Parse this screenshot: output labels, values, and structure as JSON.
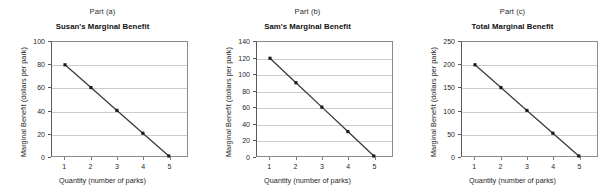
{
  "figure": {
    "background_color": "#ffffff",
    "line_color": "#3a3a3a",
    "marker_color": "#1a1a1a",
    "grid_color": "#cccccc",
    "axis_color": "#5a5a5a",
    "border_color": "#8c8c8c"
  },
  "panels": [
    {
      "part_label": "Part (a)",
      "title": "Susan's Marginal Benefit",
      "xlabel": "Quantity (number of parks)",
      "ylabel": "Marginal Benefit (dollars per park)",
      "x_ticks": [
        "1",
        "2",
        "3",
        "4",
        "5"
      ],
      "y_ticks": [
        "0",
        "20",
        "40",
        "60",
        "80",
        "100"
      ]
    },
    {
      "part_label": "Part (b)",
      "title": "Sam's Marginal Benefit",
      "xlabel": "Quantity (number of parks)",
      "ylabel": "Marginal Benefit (dollars per park)",
      "x_ticks": [
        "1",
        "2",
        "3",
        "4",
        "5"
      ],
      "y_ticks": [
        "0",
        "20",
        "40",
        "60",
        "80",
        "100",
        "120",
        "140"
      ]
    },
    {
      "part_label": "Part (c)",
      "title": "Total Marginal Benefit",
      "xlabel": "Quantity (number of parks)",
      "ylabel": "Marginal Benefit (dollars per park)",
      "x_ticks": [
        "1",
        "2",
        "3",
        "4",
        "5"
      ],
      "y_ticks": [
        "0",
        "50",
        "100",
        "150",
        "200",
        "250"
      ]
    }
  ],
  "chart_data": [
    {
      "type": "line",
      "title": "Susan's Marginal Benefit",
      "subtitle": "Part (a)",
      "xlabel": "Quantity (number of parks)",
      "ylabel": "Marginal Benefit (dollars per park)",
      "x": [
        1,
        2,
        3,
        4,
        5
      ],
      "values": [
        80,
        60,
        40,
        20,
        0
      ],
      "xlim": [
        0.5,
        5.7
      ],
      "ylim": [
        0,
        100
      ],
      "y_ticks": [
        0,
        20,
        40,
        60,
        80,
        100
      ],
      "x_ticks": [
        1,
        2,
        3,
        4,
        5
      ],
      "grid": "horizontal",
      "legend": "none",
      "markers": "square"
    },
    {
      "type": "line",
      "title": "Sam's Marginal Benefit",
      "subtitle": "Part (b)",
      "xlabel": "Quantity (number of parks)",
      "ylabel": "Marginal Benefit (dollars per park)",
      "x": [
        1,
        2,
        3,
        4,
        5
      ],
      "values": [
        120,
        90,
        60,
        30,
        0
      ],
      "xlim": [
        0.5,
        5.7
      ],
      "ylim": [
        0,
        140
      ],
      "y_ticks": [
        0,
        20,
        40,
        60,
        80,
        100,
        120,
        140
      ],
      "x_ticks": [
        1,
        2,
        3,
        4,
        5
      ],
      "grid": "horizontal",
      "legend": "none",
      "markers": "square"
    },
    {
      "type": "line",
      "title": "Total Marginal Benefit",
      "subtitle": "Part (c)",
      "xlabel": "Quantity (number of parks)",
      "ylabel": "Marginal Benefit (dollars per park)",
      "x": [
        1,
        2,
        3,
        4,
        5
      ],
      "values": [
        200,
        150,
        100,
        50,
        0
      ],
      "xlim": [
        0.5,
        5.7
      ],
      "ylim": [
        0,
        250
      ],
      "y_ticks": [
        0,
        50,
        100,
        150,
        200,
        250
      ],
      "x_ticks": [
        1,
        2,
        3,
        4,
        5
      ],
      "grid": "horizontal",
      "legend": "none",
      "markers": "square"
    }
  ]
}
